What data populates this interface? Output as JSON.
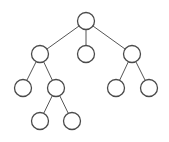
{
  "diagram": {
    "type": "tree",
    "colors": {
      "stroke": "#4a4a4a",
      "edge": "#555555",
      "fill": "#ffffff"
    },
    "nodes": [
      {
        "id": "root"
      },
      {
        "id": "a",
        "parent": "root"
      },
      {
        "id": "b",
        "parent": "root"
      },
      {
        "id": "c",
        "parent": "root"
      },
      {
        "id": "a1",
        "parent": "a"
      },
      {
        "id": "a2",
        "parent": "a"
      },
      {
        "id": "c1",
        "parent": "c"
      },
      {
        "id": "c2",
        "parent": "c"
      },
      {
        "id": "a2x",
        "parent": "a2"
      },
      {
        "id": "a2y",
        "parent": "a2"
      }
    ]
  }
}
